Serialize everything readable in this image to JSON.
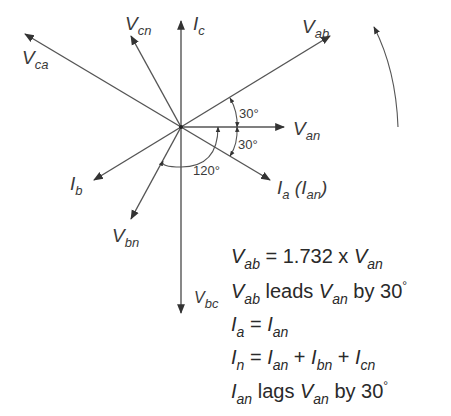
{
  "diagram": {
    "colors": {
      "stroke": "#4a4a4a",
      "text": "#3a3a3a"
    },
    "origin": [
      181,
      127
    ],
    "phasors": [
      {
        "id": "Vab",
        "main": "V",
        "sub": "ab",
        "tip": [
          330,
          36
        ]
      },
      {
        "id": "Van",
        "main": "V",
        "sub": "an",
        "tip": [
          284,
          127
        ]
      },
      {
        "id": "Ia",
        "main": "I",
        "sub": "a",
        "extra": " (I",
        "extra_sub": "an",
        "extra_close": ")",
        "tip": [
          270,
          180
        ]
      },
      {
        "id": "Ic",
        "main": "I",
        "sub": "c",
        "tip": [
          181,
          20
        ]
      },
      {
        "id": "Vcn",
        "main": "V",
        "sub": "cn",
        "tip": [
          131,
          35
        ]
      },
      {
        "id": "Vca",
        "main": "V",
        "sub": "ca",
        "tip": [
          25,
          34
        ]
      },
      {
        "id": "Ib",
        "main": "I",
        "sub": "b",
        "tip": [
          94,
          180
        ]
      },
      {
        "id": "Vbn",
        "main": "V",
        "sub": "bn",
        "tip": [
          131,
          219
        ]
      },
      {
        "id": "Vbc",
        "main": "V",
        "sub": "bc",
        "tip": [
          181,
          313
        ]
      }
    ],
    "angles": [
      {
        "label": "30°",
        "between": "Vab-Van"
      },
      {
        "label": "30°",
        "between": "Van-Ia"
      },
      {
        "label": "120°",
        "between": "Ia-Vbn"
      }
    ],
    "rotation_arrow": "counter-clockwise"
  },
  "equations": [
    {
      "parts": [
        {
          "i": "V"
        },
        {
          "sub": "ab"
        },
        {
          "t": " = 1.732 x "
        },
        {
          "i": "V"
        },
        {
          "sub": "an"
        }
      ]
    },
    {
      "parts": [
        {
          "i": "V"
        },
        {
          "sub": "ab"
        },
        {
          "t": " leads "
        },
        {
          "i": "V"
        },
        {
          "sub": "an"
        },
        {
          "t": " by 30"
        },
        {
          "deg": "°"
        }
      ]
    },
    {
      "parts": [
        {
          "i": "I"
        },
        {
          "sub": "a"
        },
        {
          "t": " = "
        },
        {
          "i": "I"
        },
        {
          "sub": "an"
        }
      ]
    },
    {
      "parts": [
        {
          "i": "I"
        },
        {
          "sub": "n"
        },
        {
          "t": " = "
        },
        {
          "i": "I"
        },
        {
          "sub": "an"
        },
        {
          "t": " + "
        },
        {
          "i": "I"
        },
        {
          "sub": "bn"
        },
        {
          "t": " + "
        },
        {
          "i": "I"
        },
        {
          "sub": "cn"
        }
      ]
    },
    {
      "parts": [
        {
          "i": "I"
        },
        {
          "sub": "an"
        },
        {
          "t": " lags "
        },
        {
          "i": "V"
        },
        {
          "sub": "an"
        },
        {
          "t": "  by 30"
        },
        {
          "deg": "°"
        }
      ]
    }
  ],
  "labels": {
    "Vab": {
      "main": "V",
      "sub": "ab"
    },
    "Van": {
      "main": "V",
      "sub": "an"
    },
    "Ia": {
      "main": "I",
      "sub": "a",
      "paren_main": "I",
      "paren_sub": "an"
    },
    "Ic": {
      "main": "I",
      "sub": "c"
    },
    "Vcn": {
      "main": "V",
      "sub": "cn"
    },
    "Vca": {
      "main": "V",
      "sub": "ca"
    },
    "Ib": {
      "main": "I",
      "sub": "b"
    },
    "Vbn": {
      "main": "V",
      "sub": "bn"
    },
    "Vbc": {
      "main": "V",
      "sub": "bc"
    },
    "angle_top": "30°",
    "angle_bottom": "30°",
    "angle_120": "120°"
  }
}
